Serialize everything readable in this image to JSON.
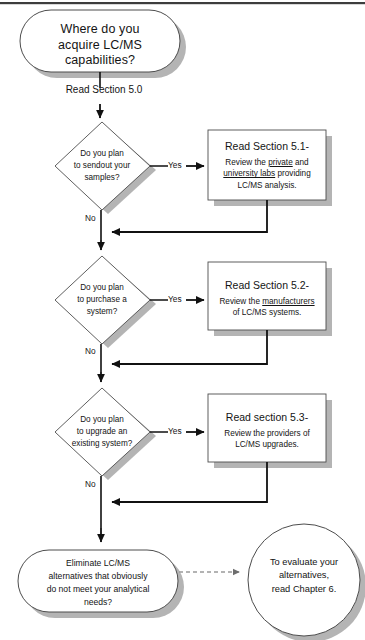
{
  "page": {
    "title": "Where do you acquire LC/MS capabilities?",
    "rule_visible": true
  },
  "start": {
    "name": "start-terminal",
    "text": "Where do you\nacquire LC/MS\ncapabilities?"
  },
  "connectors": {
    "read_section_50": "Read Section 5.0",
    "yes": "Yes",
    "no": "No"
  },
  "decisions": [
    {
      "id": "decision-sendout",
      "text": "Do you plan\nto sendout your\nsamples?",
      "yes_label": "Yes",
      "no_label": "No"
    },
    {
      "id": "decision-purchase",
      "text": "Do you plan\nto purchase a\nsystem?",
      "yes_label": "Yes",
      "no_label": "No"
    },
    {
      "id": "decision-upgrade",
      "text": "Do you plan\nto upgrade an\nexisting system?",
      "yes_label": "Yes",
      "no_label": "No"
    }
  ],
  "action_boxes": [
    {
      "id": "box-section-51",
      "title": "Read Section 5.1-",
      "body_line1_pre": "Review  the ",
      "body_line1_underline": "private",
      "body_line1_post": " and",
      "body_line2_underline": "university labs",
      "body_line2_post": " providing",
      "body_line3": "LC/MS analysis."
    },
    {
      "id": "box-section-52",
      "title": "Read Section 5.2-",
      "body_line1_pre": "Review  the ",
      "body_line1_underline": "manufacturers",
      "body_line1_post": "",
      "body_line2_underline": "",
      "body_line2_post": "of LC/MS systems.",
      "body_line3": ""
    },
    {
      "id": "box-section-53",
      "title": "Read section 5.3-",
      "body_line1_pre": "Review  the providers of",
      "body_line1_underline": "",
      "body_line1_post": "",
      "body_line2_underline": "",
      "body_line2_post": "LC/MS upgrades.",
      "body_line3": ""
    }
  ],
  "end_process": {
    "name": "eliminate-terminal",
    "text": "Eliminate LC/MS\nalternatives that obviously\ndo not meet your analytical\nneeds?"
  },
  "end_circle": {
    "name": "evaluate-circle",
    "text": "To evaluate your\nalternatives,\nread Chapter 6."
  },
  "colors": {
    "stroke": "#4d4d4d",
    "line": "#111111",
    "shadow": "#b4b4b4",
    "dashed": "#9a9a9a",
    "text": "#141414",
    "background": "#ffffff"
  }
}
